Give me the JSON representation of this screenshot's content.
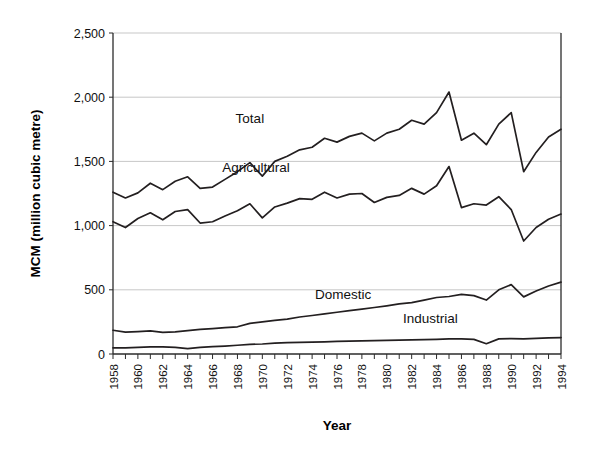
{
  "chart_data": {
    "type": "line",
    "title": "",
    "xlabel": "Year",
    "ylabel": "MCM (million cubic metre)",
    "xlim": [
      1958,
      1994
    ],
    "ylim": [
      0,
      2500
    ],
    "yticks": [
      0,
      500,
      1000,
      1500,
      2000,
      2500
    ],
    "ytick_labels": [
      "0",
      "500",
      "1,000",
      "1,500",
      "2,000",
      "2,500"
    ],
    "xtick_labels": [
      "1958",
      "1960",
      "1962",
      "1964",
      "1966",
      "1968",
      "1970",
      "1972",
      "1974",
      "1976",
      "1978",
      "1980",
      "1982",
      "1984",
      "1986",
      "1988",
      "1990",
      "1992",
      "1994"
    ],
    "xtick_interval": 2,
    "minor_tick_interval": 1,
    "grid": "horizontal",
    "legend_position": "inline-labels",
    "x": [
      1958,
      1959,
      1960,
      1961,
      1962,
      1963,
      1964,
      1965,
      1966,
      1967,
      1968,
      1969,
      1970,
      1971,
      1972,
      1973,
      1974,
      1975,
      1976,
      1977,
      1978,
      1979,
      1980,
      1981,
      1982,
      1983,
      1984,
      1985,
      1986,
      1987,
      1988,
      1989,
      1990,
      1991,
      1992,
      1993,
      1994
    ],
    "series": [
      {
        "name": "Total",
        "label": "Total",
        "values": [
          1260,
          1215,
          1255,
          1330,
          1280,
          1345,
          1380,
          1290,
          1300,
          1360,
          1420,
          1490,
          1385,
          1500,
          1540,
          1590,
          1610,
          1680,
          1650,
          1695,
          1720,
          1660,
          1720,
          1750,
          1820,
          1790,
          1880,
          2040,
          1665,
          1720,
          1630,
          1790,
          1880,
          1420,
          1570,
          1690,
          1750
        ]
      },
      {
        "name": "Agricultural",
        "label": "Agricultural",
        "values": [
          1030,
          985,
          1055,
          1100,
          1045,
          1110,
          1125,
          1020,
          1030,
          1075,
          1115,
          1170,
          1060,
          1145,
          1175,
          1210,
          1205,
          1260,
          1215,
          1245,
          1250,
          1180,
          1220,
          1235,
          1290,
          1245,
          1310,
          1460,
          1140,
          1170,
          1160,
          1225,
          1125,
          880,
          985,
          1050,
          1090
        ]
      },
      {
        "name": "Domestic",
        "label": "Domestic",
        "values": [
          185,
          170,
          175,
          180,
          168,
          172,
          182,
          192,
          198,
          205,
          212,
          238,
          250,
          262,
          272,
          288,
          300,
          312,
          325,
          338,
          350,
          362,
          375,
          390,
          400,
          420,
          440,
          448,
          465,
          455,
          420,
          500,
          540,
          445,
          490,
          530,
          560
        ]
      },
      {
        "name": "Industrial",
        "label": "Industrial",
        "values": [
          48,
          48,
          52,
          55,
          55,
          52,
          42,
          52,
          58,
          62,
          68,
          75,
          78,
          84,
          88,
          90,
          92,
          95,
          98,
          100,
          102,
          104,
          106,
          108,
          110,
          112,
          114,
          118,
          118,
          114,
          80,
          118,
          120,
          118,
          122,
          126,
          128
        ]
      }
    ],
    "annotations": [
      {
        "text": "Total",
        "x": 1969,
        "y": 1800
      },
      {
        "text": "Agricultural",
        "x": 1969.5,
        "y": 1415
      },
      {
        "text": "Domestic",
        "x": 1976.5,
        "y": 430
      },
      {
        "text": "Industrial",
        "x": 1983.5,
        "y": 240
      }
    ]
  },
  "colors": {
    "line": "#231f20",
    "grid": "#b9b9b9",
    "axis": "#2b2b2b",
    "background": "#ffffff"
  }
}
